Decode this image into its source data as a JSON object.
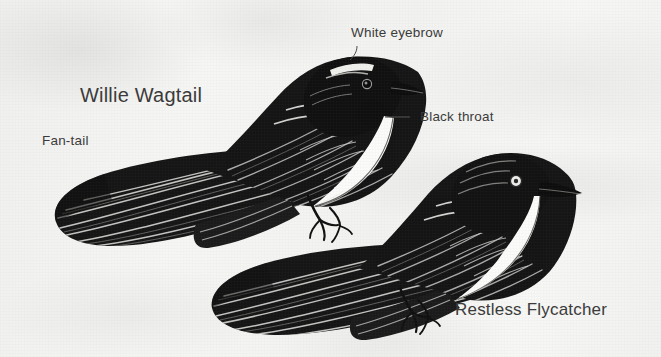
{
  "figure": {
    "kind": "bird-identification-illustration",
    "background_color": "#f3f3f1",
    "ink_color": "#1a1a1a",
    "text_color": "#3b3b3b"
  },
  "labels": {
    "white_eyebrow": "White eyebrow",
    "willie_wagtail": "Willie Wagtail",
    "black_throat": "Black throat",
    "fan_tail": "Fan-tail",
    "restless_flycatcher": "Restless Flycatcher"
  },
  "birds": [
    {
      "name": "Willie Wagtail",
      "position": "upper-left",
      "features": [
        "White eyebrow",
        "Black throat",
        "Fan-tail"
      ]
    },
    {
      "name": "Restless Flycatcher",
      "position": "lower-right",
      "features": [
        "white throat",
        "pale eye ring",
        "long bill"
      ]
    }
  ]
}
